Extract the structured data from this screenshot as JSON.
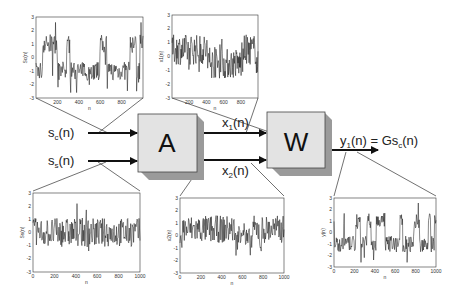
{
  "diagram": {
    "inputs": [
      {
        "label": "s",
        "sub": "c",
        "tail": "(n)"
      },
      {
        "label": "s",
        "sub": "s",
        "tail": "(n)"
      }
    ],
    "mixer": {
      "label": "A"
    },
    "mixed": [
      {
        "label": "x",
        "sub": "1",
        "tail": "(n)"
      },
      {
        "label": "x",
        "sub": "2",
        "tail": "(n)"
      }
    ],
    "separator": {
      "label": "W"
    },
    "output": {
      "label": "y",
      "sub": "1",
      "tail": "(n) = Gs",
      "sub2": "c",
      "tail2": "(n)"
    }
  },
  "chart_data": [
    {
      "type": "line",
      "id": "sc",
      "ylabel": "Sc(n)",
      "xlabel": "n",
      "xticks": [
        200,
        400,
        600,
        800
      ],
      "yticks": [
        -3,
        -2,
        -1,
        0,
        1,
        2,
        3
      ],
      "ylim": [
        -3,
        3
      ],
      "xlim": [
        0,
        1000
      ],
      "style": "switching"
    },
    {
      "type": "line",
      "id": "x1",
      "ylabel": "x1(n)",
      "xlabel": "n",
      "xticks": [
        200,
        400,
        600,
        800
      ],
      "yticks": [
        -3,
        -2,
        -1,
        0,
        1,
        2,
        3
      ],
      "ylim": [
        -3,
        3
      ],
      "xlim": [
        0,
        1000
      ],
      "style": "mixed"
    },
    {
      "type": "line",
      "id": "ss",
      "ylabel": "Ss(n)",
      "xlabel": "n",
      "xticks": [
        0,
        200,
        400,
        600,
        800,
        1000
      ],
      "yticks": [
        -3,
        -2,
        -1,
        0,
        1,
        2,
        3
      ],
      "ylim": [
        -3,
        3
      ],
      "xlim": [
        0,
        1000
      ],
      "style": "noise"
    },
    {
      "type": "line",
      "id": "x2",
      "ylabel": "x2(n)",
      "xlabel": "n",
      "xticks": [
        0,
        200,
        400,
        600,
        800,
        1000
      ],
      "yticks": [
        -3,
        -2,
        -1,
        0,
        1,
        2,
        3
      ],
      "ylim": [
        -3,
        3
      ],
      "xlim": [
        0,
        1000
      ],
      "style": "mixed"
    },
    {
      "type": "line",
      "id": "y1",
      "ylabel": "y(n)",
      "xlabel": "n",
      "xticks": [
        0,
        200,
        400,
        600,
        800,
        1000
      ],
      "yticks": [
        -3,
        -2,
        -1,
        0,
        1,
        2,
        3
      ],
      "ylim": [
        -3,
        3
      ],
      "xlim": [
        0,
        1000
      ],
      "style": "switching"
    }
  ]
}
